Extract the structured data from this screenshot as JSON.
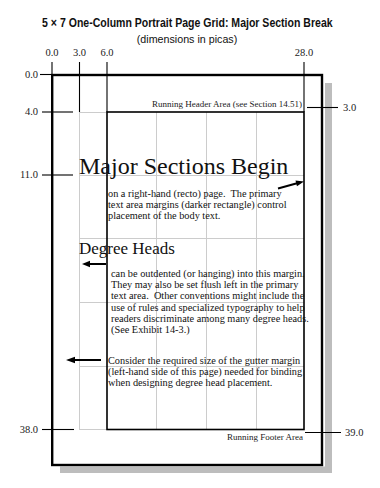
{
  "title": "5 × 7 One-Column Portrait Page Grid: Major Section Break",
  "subtitle": "(dimensions in picas)",
  "axes": {
    "top": [
      "0.0",
      "3.0",
      "6.0",
      "28.0"
    ],
    "left": [
      "0.0",
      "4.0",
      "11.0",
      "38.0"
    ],
    "right": [
      "3.0",
      "39.0"
    ]
  },
  "page": {
    "running_header": "Running Header Area (see Section 14.51)",
    "running_footer": "Running Footer Area",
    "major_section": {
      "heading": "Major Sections Begin",
      "body_lines": [
        "on a right-hand (recto) page.  The primary",
        "text area margins (darker rectangle) control",
        "placement of the body text."
      ]
    },
    "degree_heads": {
      "heading": "Degree Heads",
      "body_lines": [
        "can be outdented (or hanging) into this margin.",
        "They may also be set flush left in the primary",
        "text area.  Other conventions might include the",
        "use of rules and specialized typography to help",
        "readers discriminate among many degree heads.",
        "(See Exhibit 14-3.)"
      ]
    },
    "gutter_note": {
      "body_lines": [
        "Consider the required size of the gutter margin",
        "(left-hand side of this page) needed for binding",
        "when designing degree head placement."
      ]
    }
  },
  "icons": {
    "text_margin_arrow": "arrow-right-icon",
    "degree_head_arrow": "arrow-left-icon",
    "gutter_arrow": "arrow-left-icon"
  },
  "colors": {
    "ink": "#000000",
    "grid_line": "#cccccc",
    "page_shadow": "#bdbdbd",
    "background": "#ffffff"
  }
}
